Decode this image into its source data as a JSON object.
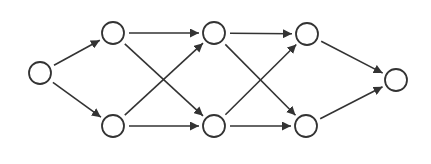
{
  "diagram": {
    "type": "directed-graph",
    "colors": {
      "stroke": "#333333",
      "node_fill": "#ffffff",
      "background": "#ffffff"
    },
    "node_radius": 11,
    "nodes": [
      {
        "id": "s",
        "x": 40,
        "y": 73
      },
      {
        "id": "a1",
        "x": 113,
        "y": 33
      },
      {
        "id": "a2",
        "x": 113,
        "y": 126
      },
      {
        "id": "b1",
        "x": 214,
        "y": 33
      },
      {
        "id": "b2",
        "x": 214,
        "y": 126
      },
      {
        "id": "c1",
        "x": 307,
        "y": 34
      },
      {
        "id": "c2",
        "x": 306,
        "y": 126
      },
      {
        "id": "t",
        "x": 396,
        "y": 80
      }
    ],
    "edges": [
      {
        "from": "s",
        "to": "a1"
      },
      {
        "from": "s",
        "to": "a2"
      },
      {
        "from": "a1",
        "to": "b1"
      },
      {
        "from": "a1",
        "to": "b2"
      },
      {
        "from": "a2",
        "to": "b1"
      },
      {
        "from": "a2",
        "to": "b2"
      },
      {
        "from": "b1",
        "to": "c1"
      },
      {
        "from": "b1",
        "to": "c2"
      },
      {
        "from": "b2",
        "to": "c1"
      },
      {
        "from": "b2",
        "to": "c2"
      },
      {
        "from": "c1",
        "to": "t"
      },
      {
        "from": "c2",
        "to": "t"
      }
    ]
  }
}
